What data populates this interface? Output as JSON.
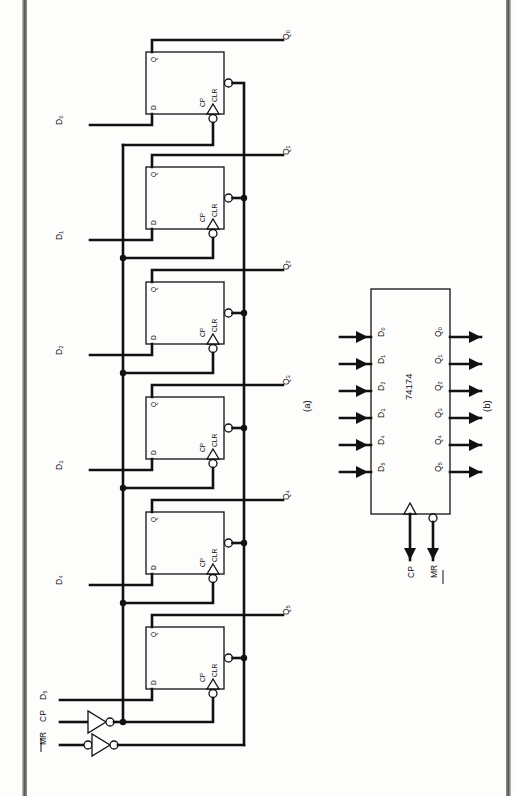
{
  "figure": {
    "part_a_caption": "(a)",
    "part_b_caption": "(b)",
    "device_label": "74174"
  },
  "schematic": {
    "stage_count": 6,
    "flipflop_pins": {
      "q": "Q",
      "d": "D",
      "cp": "CP",
      "clr": "CLR"
    },
    "data_inputs": [
      "D₀",
      "D₁",
      "D₂",
      "D₃",
      "D₄",
      "D₅"
    ],
    "outputs": [
      "Q₀",
      "Q₁",
      "Q₂",
      "Q₃",
      "Q₄",
      "Q₅"
    ],
    "control_inputs": [
      {
        "label": "CP",
        "overbar": false
      },
      {
        "label": "MR",
        "overbar": true
      }
    ],
    "inverters": [
      {
        "name": "clock-inverter",
        "input_bubble": false,
        "output_bubble": true
      },
      {
        "name": "reset-inverter",
        "input_bubble": true,
        "output_bubble": true
      }
    ]
  },
  "block": {
    "device_label": "74174",
    "inputs": [
      "D₀",
      "D₁",
      "D₂",
      "D₃",
      "D₄",
      "D₅"
    ],
    "outputs": [
      "Q₀",
      "Q₁",
      "Q₂",
      "Q₃",
      "Q₄",
      "Q₅"
    ],
    "clock_pin": {
      "label": "CP",
      "dynamic": true
    },
    "reset_pin": {
      "label": "MR",
      "overbar": true,
      "active_low_bubble": true
    }
  }
}
